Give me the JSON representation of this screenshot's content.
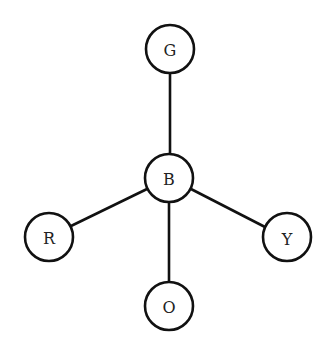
{
  "diagram": {
    "type": "star-graph",
    "colors": {
      "stroke": "#111111",
      "fill": "#ffffff",
      "text": "#222222"
    },
    "nodes": [
      {
        "id": "G",
        "label": "G",
        "x": 170,
        "y": 49,
        "r": 24
      },
      {
        "id": "B",
        "label": "B",
        "x": 169,
        "y": 178,
        "r": 24
      },
      {
        "id": "R",
        "label": "R",
        "x": 49,
        "y": 237,
        "r": 24
      },
      {
        "id": "Y",
        "label": "Y",
        "x": 287,
        "y": 237,
        "r": 24
      },
      {
        "id": "O",
        "label": "O",
        "x": 169,
        "y": 306,
        "r": 24
      }
    ],
    "edges": [
      {
        "from": "B",
        "to": "G"
      },
      {
        "from": "B",
        "to": "R"
      },
      {
        "from": "B",
        "to": "Y"
      },
      {
        "from": "B",
        "to": "O"
      }
    ]
  }
}
